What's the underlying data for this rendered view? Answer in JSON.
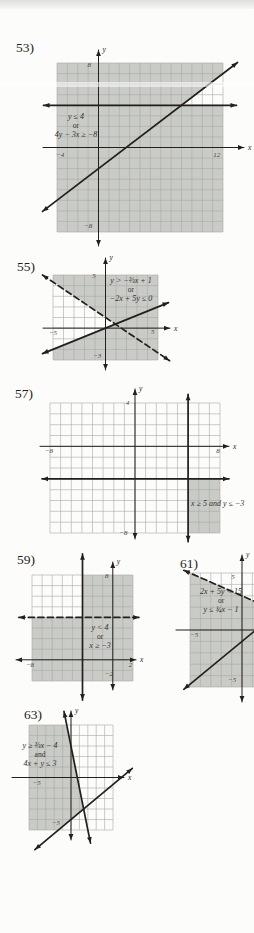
{
  "page": {
    "background": "#fcfcfa",
    "ink": "#221f1c",
    "shade_color": "#c9cbc7",
    "grid_color": "#a9a9a5",
    "tick_color": "#4a443c"
  },
  "chart_data": [
    {
      "type": "linear-inequality-region",
      "number": "53)",
      "conditions": [
        "y ≤ 4",
        "or",
        "4y − 3x ≥ −8"
      ],
      "x_range": [
        -4,
        12
      ],
      "y_range": [
        -8,
        8
      ],
      "x_label": "x",
      "y_label": "y",
      "ticks": [
        {
          "t": "8",
          "at": [
            -0.9,
            7.6
          ]
        },
        {
          "t": "−4",
          "at": [
            -3.7,
            -0.85
          ]
        },
        {
          "t": "12",
          "at": [
            11.4,
            -0.85
          ]
        },
        {
          "t": "−8",
          "at": [
            -1.0,
            -7.6
          ]
        }
      ],
      "lines": [
        {
          "eq": "y = 4",
          "style": "solid",
          "p1": [
            -5.3,
            4
          ],
          "p2": [
            13.3,
            4
          ],
          "arrows": "both"
        },
        {
          "eq": "4y − 3x = −8",
          "style": "solid",
          "p1": [
            -5.4,
            -6.05
          ],
          "p2": [
            13.4,
            8.05
          ],
          "arrows": "both"
        }
      ],
      "shade": [
        [
          -4,
          -8
        ],
        [
          12,
          -8
        ],
        [
          12,
          4
        ],
        [
          8,
          4
        ],
        [
          12,
          7
        ],
        [
          12,
          8
        ],
        [
          -4,
          8
        ]
      ]
    },
    {
      "type": "linear-inequality-region",
      "number": "55)",
      "conditions": [
        "y > −⅔x + 1",
        "or",
        "−2x + 5y ≤ 0"
      ],
      "x_range": [
        -5,
        5
      ],
      "y_range": [
        -3,
        5
      ],
      "x_label": "x",
      "y_label": "y",
      "ticks": [
        {
          "t": "5",
          "at": [
            -1.1,
            4.75
          ]
        },
        {
          "t": "−5",
          "at": [
            -5.0,
            -0.62
          ]
        },
        {
          "t": "5",
          "at": [
            4.5,
            -0.55
          ]
        },
        {
          "t": "−3",
          "at": [
            -0.8,
            -2.85
          ]
        }
      ],
      "lines": [
        {
          "eq": "y = −⅔x + 1",
          "style": "dashed",
          "p1": [
            -6.0,
            5.0
          ],
          "p2": [
            6.1,
            -3.07
          ],
          "arrows": "both"
        },
        {
          "eq": "−2x + 5y = 0",
          "style": "solid",
          "p1": [
            -6.0,
            -2.4
          ],
          "p2": [
            6.0,
            2.4
          ],
          "arrows": "both"
        }
      ],
      "shade": [
        [
          -5,
          5
        ],
        [
          5,
          5
        ],
        [
          5,
          -3
        ],
        [
          -5,
          -3
        ],
        [
          -5,
          -2
        ],
        [
          0.94,
          0.38
        ],
        [
          -5,
          4.33
        ]
      ]
    },
    {
      "type": "linear-inequality-region",
      "number": "57)",
      "conditions": [
        "x ≥ 5 and y ≤ −3"
      ],
      "x_range": [
        -8,
        8
      ],
      "y_range": [
        -8,
        4
      ],
      "x_label": "x",
      "y_label": "y",
      "ticks": [
        {
          "t": "4",
          "at": [
            -0.7,
            3.8
          ]
        },
        {
          "t": "−8",
          "at": [
            -8.1,
            -0.65
          ]
        },
        {
          "t": "8",
          "at": [
            7.8,
            -0.65
          ]
        },
        {
          "t": "−8",
          "at": [
            -1.1,
            -8.2
          ]
        }
      ],
      "lines": [
        {
          "eq": "x = 5",
          "style": "solid",
          "p1": [
            5,
            4.8
          ],
          "p2": [
            5,
            -8.8
          ],
          "arrows": "both"
        },
        {
          "eq": "y = −3",
          "style": "solid",
          "p1": [
            -8.75,
            -3
          ],
          "p2": [
            8.85,
            -3
          ],
          "arrows": "both"
        }
      ],
      "shade": [
        [
          5,
          -3
        ],
        [
          8,
          -3
        ],
        [
          8,
          -8
        ],
        [
          5,
          -8
        ]
      ]
    },
    {
      "type": "linear-inequality-region",
      "number": "59)",
      "conditions": [
        "y < 4",
        "or",
        "x ≥ −3"
      ],
      "x_range": [
        -8,
        2
      ],
      "y_range": [
        -2,
        8
      ],
      "x_label": "x",
      "y_label": "y",
      "ticks": [
        {
          "t": "8",
          "at": [
            -0.6,
            7.75
          ]
        },
        {
          "t": "−8",
          "at": [
            -8.2,
            -0.7
          ]
        },
        {
          "t": "2",
          "at": [
            1.75,
            -0.7
          ]
        },
        {
          "t": "−2",
          "at": [
            -0.4,
            -1.55
          ]
        }
      ],
      "lines": [
        {
          "eq": "y = 4",
          "style": "dashed",
          "p1": [
            -9.3,
            4
          ],
          "p2": [
            2.6,
            4
          ],
          "arrows": "both"
        },
        {
          "eq": "x = −3",
          "style": "solid",
          "p1": [
            -3,
            10.0
          ],
          "p2": [
            -3,
            -3.8
          ],
          "arrows": "both"
        }
      ],
      "shade": [
        [
          -8,
          -2
        ],
        [
          2,
          -2
        ],
        [
          2,
          8
        ],
        [
          -3,
          8
        ],
        [
          -3,
          4
        ],
        [
          -8,
          4
        ]
      ]
    },
    {
      "type": "linear-inequality-region",
      "number": "61)",
      "conditions": [
        "2x + 5y < 15",
        "or",
        "y ≤ ¾x − 1"
      ],
      "x_range": [
        -5,
        5
      ],
      "y_range": [
        -5,
        5
      ],
      "y_label": "y",
      "ticks": [
        {
          "t": "5",
          "at": [
            -0.87,
            4.45
          ]
        },
        {
          "t": "−5",
          "at": [
            -4.6,
            -0.6
          ]
        },
        {
          "t": "−5",
          "at": [
            -0.95,
            -4.6
          ]
        }
      ],
      "lines": [
        {
          "eq": "2x + 5y = 15",
          "style": "dashed",
          "p1": [
            -5.6,
            5.24
          ],
          "p2": [
            1.6,
            2.36
          ],
          "arrows": "start"
        },
        {
          "eq": "y = ¾x − 1",
          "style": "solid",
          "p1": [
            -5.6,
            -5.2
          ],
          "p2": [
            1.6,
            0.2
          ],
          "arrows": "start"
        }
      ],
      "shade": [
        [
          -5,
          5
        ],
        [
          5,
          1
        ],
        [
          5,
          -5
        ],
        [
          -5,
          -5
        ]
      ]
    },
    {
      "type": "linear-inequality-region",
      "number": "63)",
      "conditions": [
        "y ≥ ⅔x − 4",
        "and",
        "4x + y ≤ 3"
      ],
      "x_range": [
        -5,
        5
      ],
      "y_range": [
        -5,
        5
      ],
      "x_label": "x",
      "y_label": "y",
      "ticks": [
        {
          "t": "−5",
          "at": [
            -4.1,
            -0.7
          ]
        },
        {
          "t": "−5",
          "at": [
            -1.8,
            -4.5
          ]
        }
      ],
      "lines": [
        {
          "eq": "4x + y = 3",
          "style": "solid",
          "p1": [
            -0.83,
            6.3
          ],
          "p2": [
            2.32,
            -6.25
          ],
          "arrows": "both"
        },
        {
          "eq": "y = ⅔x − 4",
          "style": "solid",
          "p1": [
            -4.3,
            -6.87
          ],
          "p2": [
            7.3,
            0.87
          ],
          "arrows": "both"
        }
      ],
      "shade": [
        [
          -5,
          5
        ],
        [
          -0.5,
          5
        ],
        [
          1.5,
          -3
        ],
        [
          -1.5,
          -5
        ],
        [
          -5,
          -5
        ]
      ]
    }
  ]
}
